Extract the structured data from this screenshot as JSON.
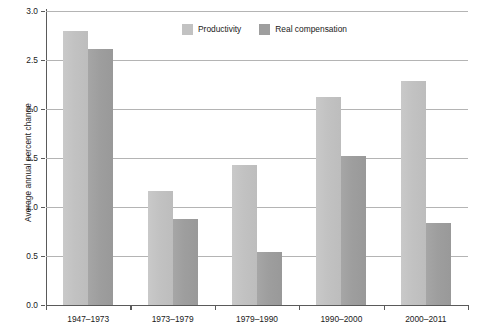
{
  "chart_data": {
    "type": "bar",
    "title": "",
    "subtitle": "",
    "xlabel": "",
    "ylabel": "Average annual percent change",
    "ylim": [
      0.0,
      3.0
    ],
    "ytick_labels": [
      "0.0",
      "0.5",
      "1.0",
      "1.5",
      "2.0",
      "2.5",
      "3.0"
    ],
    "ytick_values": [
      0.0,
      0.5,
      1.0,
      1.5,
      2.0,
      2.5,
      3.0
    ],
    "grid": "horizontal",
    "legend_position": "top-center",
    "categories": [
      "1947–1973",
      "1973–1979",
      "1979–1990",
      "1990–2000",
      "2000–2011"
    ],
    "series": [
      {
        "name": "Productivity",
        "color": "#c2c2c2",
        "values": [
          2.8,
          1.16,
          1.43,
          2.12,
          2.29
        ]
      },
      {
        "name": "Real compensation",
        "color": "#9e9e9e",
        "values": [
          2.61,
          0.88,
          0.54,
          1.52,
          0.84
        ]
      }
    ]
  },
  "legend": {
    "items": [
      {
        "label": "Productivity",
        "color": "#c2c2c2"
      },
      {
        "label": "Real compensation",
        "color": "#9e9e9e"
      }
    ]
  },
  "axes": {
    "y_title": "Average annual percent change"
  }
}
